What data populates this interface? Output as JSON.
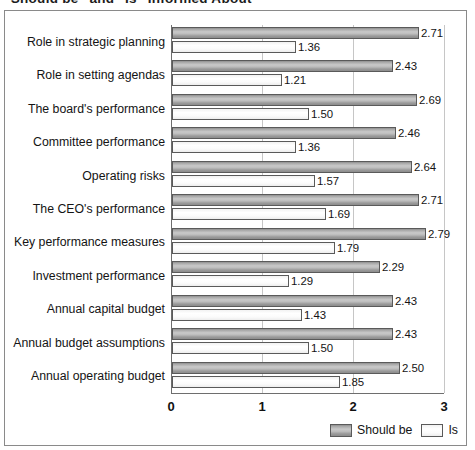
{
  "title": {
    "text": "\"Should be\" and \"Is\" Informed About",
    "clipped": true
  },
  "chart_data": {
    "type": "bar",
    "orientation": "horizontal",
    "title": "\"Should be\" and \"Is\" Informed About",
    "xlabel": "",
    "ylabel": "",
    "xlim": [
      0,
      3
    ],
    "xticks": [
      "0",
      "1",
      "2",
      "3"
    ],
    "grid": true,
    "grid_axis": "x",
    "legend_position": "bottom-right",
    "categories": [
      "Role in strategic planning",
      "Role in setting agendas",
      "The board's performance",
      "Committee performance",
      "Operating risks",
      "The CEO's performance",
      "Key performance measures",
      "Investment performance",
      "Annual capital budget",
      "Annual budget assumptions",
      "Annual operating budget"
    ],
    "series": [
      {
        "name": "Should be",
        "color": "#b4b4b4",
        "values": [
          2.71,
          2.43,
          2.69,
          2.46,
          2.64,
          2.71,
          2.79,
          2.29,
          2.43,
          2.43,
          2.5
        ],
        "labels": [
          "2.71",
          "2.43",
          "2.69",
          "2.46",
          "2.64",
          "2.71",
          "2.79",
          "2.29",
          "2.43",
          "2.43",
          "2.50"
        ]
      },
      {
        "name": "Is",
        "color": "#ffffff",
        "values": [
          1.36,
          1.21,
          1.5,
          1.36,
          1.57,
          1.69,
          1.79,
          1.29,
          1.43,
          1.5,
          1.85
        ],
        "labels": [
          "1.36",
          "1.21",
          "1.50",
          "1.36",
          "1.57",
          "1.69",
          "1.79",
          "1.29",
          "1.43",
          "1.50",
          "1.85"
        ]
      }
    ]
  },
  "legend": {
    "items": [
      {
        "label": "Should be",
        "swatch": "should-be"
      },
      {
        "label": "Is",
        "swatch": "is"
      }
    ]
  }
}
